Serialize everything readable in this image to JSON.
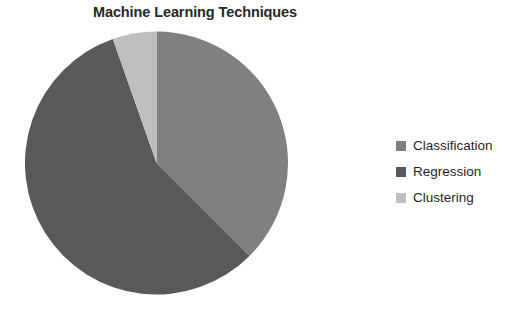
{
  "chart_data": {
    "type": "pie",
    "title": "Machine Learning Techniques",
    "xlabel": "",
    "ylabel": "",
    "categories": [
      "Classification",
      "Regression",
      "Clustering"
    ],
    "values": [
      37.5,
      57.0,
      5.5
    ],
    "value_unit": "percent",
    "colors": [
      "#808080",
      "#595959",
      "#bfbfbf"
    ],
    "legend_position": "right",
    "grid": false,
    "start_angle_deg": 0,
    "direction": "clockwise",
    "slices": [
      {
        "label": "Classification",
        "value": 37.5,
        "color": "#808080",
        "start_deg": 0.0,
        "end_deg": 135.0
      },
      {
        "label": "Regression",
        "value": 57.0,
        "color": "#595959",
        "start_deg": 135.0,
        "end_deg": 340.6
      },
      {
        "label": "Clustering",
        "value": 5.5,
        "color": "#bfbfbf",
        "start_deg": 340.6,
        "end_deg": 360.0
      }
    ]
  },
  "legend": {
    "items": [
      {
        "label": "Classification",
        "color": "#808080"
      },
      {
        "label": "Regression",
        "color": "#595959"
      },
      {
        "label": "Clustering",
        "color": "#bfbfbf"
      }
    ]
  }
}
